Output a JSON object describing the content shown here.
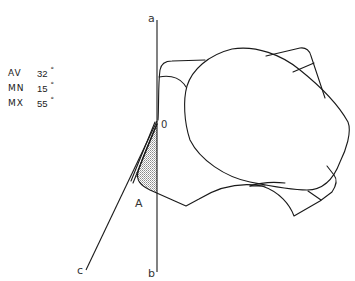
{
  "stats": [
    {
      "label": "AV",
      "value": "32",
      "unit": "°"
    },
    {
      "label": "MN",
      "value": "15",
      "unit": "°"
    },
    {
      "label": "MX",
      "value": "55",
      "unit": "°"
    }
  ],
  "labels": {
    "line_a": "a",
    "line_b": "b",
    "line_c": "c",
    "origin": "0",
    "point_a": "A"
  },
  "colors": {
    "stroke": "#1a1a1a",
    "shade": "#9a9a9a"
  }
}
